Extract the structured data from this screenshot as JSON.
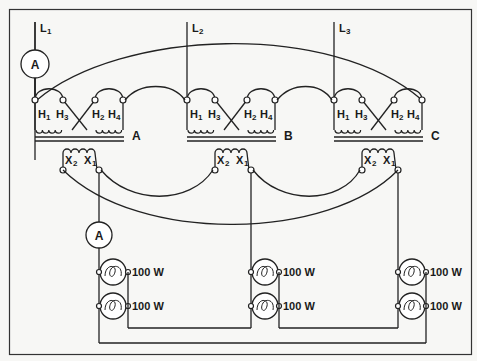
{
  "diagram": {
    "title": "",
    "lines": [
      {
        "id": "L1",
        "label": "L",
        "sub": "1"
      },
      {
        "id": "L2",
        "label": "L",
        "sub": "2"
      },
      {
        "id": "L3",
        "label": "L",
        "sub": "3"
      }
    ],
    "transformers": [
      {
        "id": "A",
        "label": "A"
      },
      {
        "id": "B",
        "label": "B"
      },
      {
        "id": "C",
        "label": "C"
      }
    ],
    "primary_terminals": {
      "h1": "H",
      "h1_sub": "1",
      "h3": "H",
      "h3_sub": "3",
      "h2": "H",
      "h2_sub": "2",
      "h4": "H",
      "h4_sub": "4"
    },
    "secondary_terminals": {
      "x2": "X",
      "x2_sub": "2",
      "x1": "X",
      "x1_sub": "1"
    },
    "ammeters": [
      {
        "id": "primary-ammeter",
        "label": "A"
      },
      {
        "id": "secondary-ammeter",
        "label": "A"
      }
    ],
    "lamps": [
      {
        "group": "A",
        "position": "top",
        "rating": "100 W"
      },
      {
        "group": "A",
        "position": "bottom",
        "rating": "100 W"
      },
      {
        "group": "B",
        "position": "top",
        "rating": "100 W"
      },
      {
        "group": "B",
        "position": "bottom",
        "rating": "100 W"
      },
      {
        "group": "C",
        "position": "top",
        "rating": "100 W"
      },
      {
        "group": "C",
        "position": "bottom",
        "rating": "100 W"
      }
    ]
  }
}
